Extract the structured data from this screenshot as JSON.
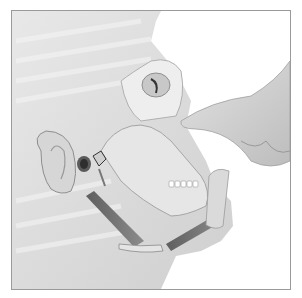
{
  "illustration": {
    "subject": "anatomical illustration of head in profile with skull, jaw and hand pointing at nose",
    "style": "grayscale medical drawing",
    "colors": {
      "background": "#ffffff",
      "border": "#9a9a9a",
      "skin": "#dcdcdc",
      "bone": "#ececec",
      "shadow": "#8a8a8a",
      "muscle": "#6e6e6e"
    }
  }
}
